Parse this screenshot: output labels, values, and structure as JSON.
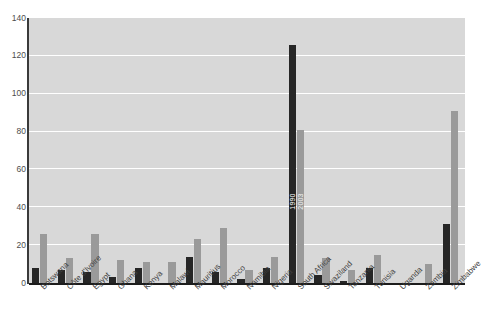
{
  "chart_data": {
    "type": "bar",
    "title": "",
    "xlabel": "",
    "ylabel": "",
    "ylim": [
      0,
      140
    ],
    "yticks": [
      0,
      20,
      40,
      60,
      80,
      100,
      120,
      140
    ],
    "grid": true,
    "legend_position": "in-bar (South Africa)",
    "categories": [
      "Botswana",
      "Côte d'Ivoire",
      "Egypt",
      "Ghana",
      "Kenya",
      "Malawi",
      "Mauritius",
      "Morocco",
      "Namibia",
      "Nigeria",
      "South Africa",
      "Swaziland",
      "Tanzania",
      "Tunisia",
      "Uganda",
      "Zambia",
      "Zimbabwe"
    ],
    "series": [
      {
        "name": "1990",
        "color": "#262626",
        "values": [
          8,
          7,
          6,
          3,
          8,
          0,
          14,
          6,
          2,
          8,
          126,
          4,
          1,
          8,
          0,
          0,
          31
        ]
      },
      {
        "name": "2003",
        "color": "#9a9a9a",
        "values": [
          26,
          13,
          26,
          12,
          11,
          11,
          23,
          29,
          7,
          14,
          81,
          13,
          7,
          15,
          0,
          10,
          91
        ]
      }
    ],
    "inline_labels": {
      "series_1990": "1990",
      "series_2003": "2003"
    },
    "colors": {
      "plot_background": "#d8d8d8",
      "gridline": "#ffffff",
      "axis": "#1c1c1c",
      "tick_text": "#4d4d4d",
      "bar_1990": "#262626",
      "bar_2003": "#9a9a9a"
    }
  }
}
